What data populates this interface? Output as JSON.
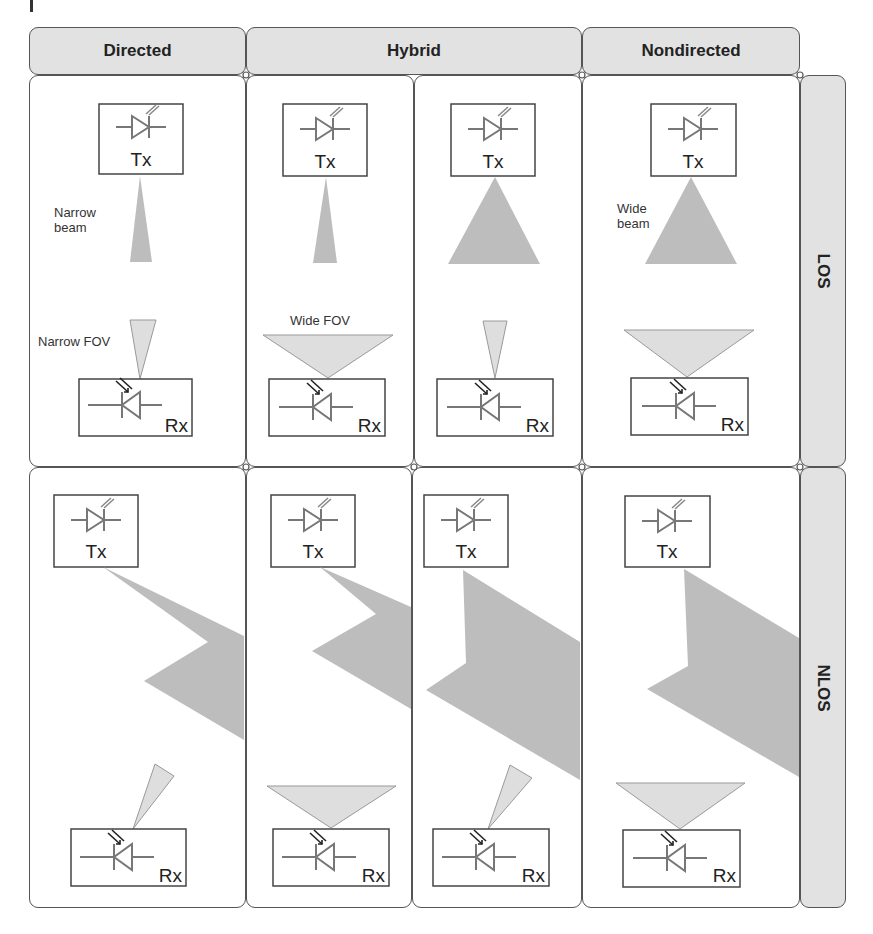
{
  "columns": [
    {
      "label": "Directed"
    },
    {
      "label": "Hybrid"
    },
    {
      "label": "Nondirected"
    }
  ],
  "rows": [
    {
      "label": "LOS"
    },
    {
      "label": "NLOS"
    }
  ],
  "devices": {
    "transmitter": "Tx",
    "receiver": "Rx"
  },
  "annotations": {
    "narrow_beam": [
      "Narrow",
      "beam"
    ],
    "narrow_fov": "Narrow FOV",
    "wide_fov": "Wide FOV",
    "wide_beam": [
      "Wide",
      "beam"
    ]
  },
  "colors": {
    "header_fill": "#e2e2e2",
    "border": "#555555",
    "beam_dark": "#b9b9b9",
    "fov_light": "#dcdcdc",
    "component_line": "#777777"
  }
}
